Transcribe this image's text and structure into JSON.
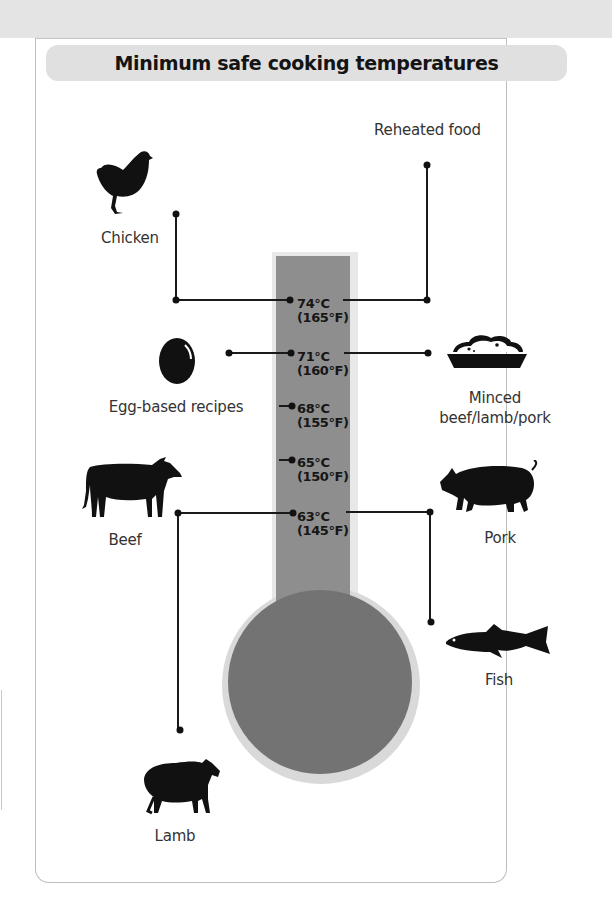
{
  "title": "Minimum safe cooking temperatures",
  "colors": {
    "title_bar": "#e0e0e0",
    "thermometer": "#8e8e8e",
    "bulb": "#737373",
    "ink": "#111111"
  },
  "temperatures": [
    {
      "celsius": "74°C",
      "fahrenheit": "(165°F)"
    },
    {
      "celsius": "71°C",
      "fahrenheit": "(160°F)"
    },
    {
      "celsius": "68°C",
      "fahrenheit": "(155°F)"
    },
    {
      "celsius": "65°C",
      "fahrenheit": "(150°F)"
    },
    {
      "celsius": "63°C",
      "fahrenheit": "(145°F)"
    }
  ],
  "foods": {
    "chicken": {
      "label": "Chicken",
      "icon": "chicken-icon",
      "temp": "74°C"
    },
    "reheated": {
      "label": "Reheated food",
      "temp": "74°C"
    },
    "egg": {
      "label": "Egg-based recipes",
      "icon": "egg-icon",
      "temp": "71°C"
    },
    "minced": {
      "label_line1": "Minced",
      "label_line2": "beef/lamb/pork",
      "icon": "minced-meat-dish-icon",
      "temp": "71°C"
    },
    "beef": {
      "label": "Beef",
      "icon": "cow-icon",
      "temp": "63°C"
    },
    "pork": {
      "label": "Pork",
      "icon": "pig-icon",
      "temp": "63°C"
    },
    "fish": {
      "label": "Fish",
      "icon": "fish-icon",
      "temp": "63°C"
    },
    "lamb": {
      "label": "Lamb",
      "icon": "sheep-icon",
      "temp": "63°C"
    }
  }
}
